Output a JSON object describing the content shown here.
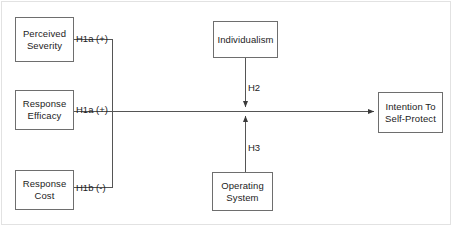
{
  "diagram": {
    "type": "path-model",
    "background_color": "#ffffff",
    "border_color": "#6e6e6e",
    "line_color": "#555555",
    "text_color": "#1c1c1c",
    "nodes": {
      "perceived_severity": {
        "label": "Perceived\nSeverity"
      },
      "response_efficacy": {
        "label": "Response\nEfficacy"
      },
      "response_cost": {
        "label": "Response\nCost"
      },
      "individualism": {
        "label": "Individualism"
      },
      "operating_system": {
        "label": "Operating\nSystem"
      },
      "intention": {
        "label": "Intention To\nSelf-Protect"
      }
    },
    "edges": {
      "h1a_severity": {
        "label": "H1a (+)",
        "from": "perceived_severity",
        "to": "intention",
        "sign": "+"
      },
      "h1a_efficacy": {
        "label": "H1a (+)",
        "from": "response_efficacy",
        "to": "intention",
        "sign": "+"
      },
      "h1b_cost": {
        "label": "H1b (-)",
        "from": "response_cost",
        "to": "intention",
        "sign": "-"
      },
      "h2": {
        "label": "H2",
        "from": "individualism",
        "to": "main-path",
        "sign": ""
      },
      "h3": {
        "label": "H3",
        "from": "operating_system",
        "to": "main-path",
        "sign": ""
      }
    }
  }
}
